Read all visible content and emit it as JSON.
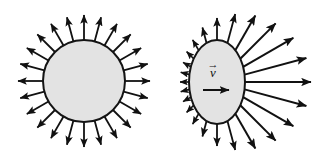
{
  "figure": {
    "background_color": "#ffffff",
    "width": 321,
    "height": 168,
    "stroke_color": "#111111",
    "body_fill_color": "#e3e3e3",
    "body_stroke_color": "#141414"
  },
  "panels": [
    {
      "id": "stationary-source",
      "name": "stationary-source-panel",
      "caption": "",
      "shape": "circle",
      "center_x": 84,
      "center_y": 81,
      "radius_x": 41,
      "radius_y": 41,
      "arrow_count": 24,
      "arrow_length_min": 25,
      "arrow_length_max": 25,
      "anisotropy": 0.0,
      "velocity_label": "",
      "velocity_accent": ""
    },
    {
      "id": "moving-source",
      "name": "moving-source-panel",
      "caption": "",
      "shape": "ellipse",
      "center_x": 217,
      "center_y": 82,
      "radius_x": 28,
      "radius_y": 42,
      "arrow_count": 24,
      "arrow_length_min": 9,
      "arrow_length_max": 66,
      "anisotropy": 1.0,
      "velocity_label": "v",
      "velocity_accent": "→",
      "velocity_arrow_x1": 203,
      "velocity_arrow_x2": 229,
      "velocity_arrow_y": 90,
      "velocity_label_x": 213,
      "velocity_label_y": 77
    }
  ],
  "legend": {
    "visible": false,
    "entries": []
  },
  "chart_data": {
    "type": "diagram",
    "series": [
      {
        "name": "stationary-source-arrows",
        "description": "Uniform-length arrows radiating from a circle",
        "angles_deg": [
          0,
          15,
          30,
          45,
          60,
          75,
          90,
          105,
          120,
          135,
          150,
          165,
          180,
          195,
          210,
          225,
          240,
          255,
          270,
          285,
          300,
          315,
          330,
          345
        ],
        "lengths": [
          25,
          25,
          25,
          25,
          25,
          25,
          25,
          25,
          25,
          25,
          25,
          25,
          25,
          25,
          25,
          25,
          25,
          25,
          25,
          25,
          25,
          25,
          25,
          25
        ]
      },
      {
        "name": "moving-source-arrows",
        "description": "Arrow length increases toward the direction of motion (+x)",
        "angles_deg": [
          0,
          15,
          30,
          45,
          60,
          75,
          90,
          105,
          120,
          135,
          150,
          165,
          180,
          195,
          210,
          225,
          240,
          255,
          270,
          285,
          300,
          315,
          330,
          345
        ],
        "lengths": [
          66,
          64,
          58,
          50,
          40,
          30,
          22,
          16,
          12,
          10,
          9,
          9,
          9,
          9,
          9,
          10,
          12,
          16,
          22,
          30,
          40,
          50,
          58,
          64
        ]
      }
    ]
  }
}
